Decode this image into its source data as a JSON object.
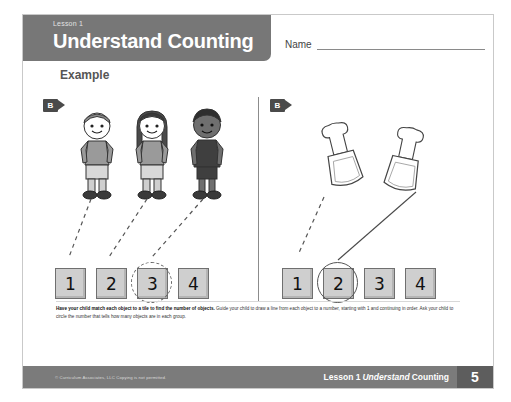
{
  "header": {
    "kicker": "Lesson 1",
    "title": "Understand Counting",
    "example_label": "Example",
    "name_label": "Name"
  },
  "panels": {
    "left": {
      "badge": "B",
      "objects": [
        "child-boy",
        "child-girl",
        "child-child"
      ],
      "tiles": [
        {
          "value": "1",
          "circled": false,
          "circle_style": "none"
        },
        {
          "value": "2",
          "circled": false,
          "circle_style": "none"
        },
        {
          "value": "3",
          "circled": true,
          "circle_style": "dashed"
        },
        {
          "value": "4",
          "circled": false,
          "circle_style": "none"
        }
      ]
    },
    "right": {
      "badge": "B",
      "objects": [
        "beach-shovel",
        "beach-shovel"
      ],
      "tiles": [
        {
          "value": "1",
          "circled": false,
          "circle_style": "none"
        },
        {
          "value": "2",
          "circled": true,
          "circle_style": "solid"
        },
        {
          "value": "3",
          "circled": false,
          "circle_style": "none"
        },
        {
          "value": "4",
          "circled": false,
          "circle_style": "none"
        }
      ]
    }
  },
  "footer": {
    "note_bold": "Have your child match each object to a tile to find the number of objects.",
    "note_rest": " Guide your child to draw a line from each object to a number, starting with 1 and continuing in order. Ask your child to circle the number that tells how many objects are in each group.",
    "copyright": "© Curriculum Associates, LLC   Copying is not permitted.",
    "lesson_prefix": "Lesson 1",
    "lesson_title_italic": "Understand",
    "lesson_title_rest": "Counting",
    "page_number": "5"
  },
  "colors": {
    "header_gray": "#777777",
    "footer_gray": "#7b7b7b",
    "tile_gray": "#cfcfcf",
    "badge_dark": "#4a4a4a"
  }
}
